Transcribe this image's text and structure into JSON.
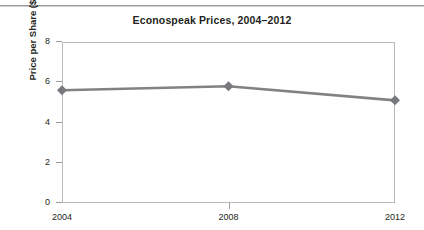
{
  "chart_data": {
    "type": "line",
    "title": "Econospeak Prices, 2004–2012",
    "xlabel": "",
    "ylabel": "Price per Share ($)",
    "categories": [
      "2004",
      "2008",
      "2012"
    ],
    "x": [
      2004,
      2008,
      2012
    ],
    "values": [
      5.6,
      5.8,
      5.1
    ],
    "series": [
      {
        "name": "Price per Share ($)",
        "values": [
          5.6,
          5.8,
          5.1
        ]
      }
    ],
    "ylim": [
      0,
      8
    ],
    "xlim": [
      2004,
      2012
    ],
    "yticks": [
      0,
      2,
      4,
      6,
      8
    ],
    "ytick_labels": [
      "0",
      "2",
      "4",
      "6",
      "8"
    ],
    "xticks": [
      2004,
      2008,
      2012
    ],
    "xtick_labels": [
      "2004",
      "2008",
      "2012"
    ],
    "grid": false,
    "legend": false,
    "legend_position": "none",
    "marker": "diamond",
    "line_color": "#808285",
    "marker_color": "#77797c",
    "axis_color": "#b9babc",
    "text_color": "#231f20",
    "background_color": "#ffffff"
  }
}
